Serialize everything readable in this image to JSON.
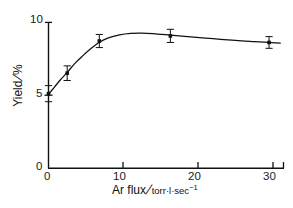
{
  "chart_data": {
    "type": "scatter",
    "title": "",
    "xlabel": "Ar flux / torr·l·sec⁻¹",
    "ylabel": "Yield/%",
    "xlim": [
      0,
      31.5
    ],
    "ylim": [
      0,
      10
    ],
    "xticks": [
      0,
      10,
      20,
      30
    ],
    "yticks": [
      0,
      5,
      10
    ],
    "xtick_labels": [
      "0",
      "10",
      "20",
      "30"
    ],
    "ytick_labels": [
      "0",
      "5",
      "10"
    ],
    "grid": false,
    "legend": null,
    "x": [
      0,
      2.5,
      6.8,
      16.3,
      29.5
    ],
    "values": [
      5.1,
      6.5,
      8.7,
      9.05,
      8.6
    ],
    "yerr": [
      0.55,
      0.5,
      0.45,
      0.45,
      0.4
    ],
    "marker": "square",
    "marker_color": "#111111",
    "line_color": "#111111",
    "fit_curve": [
      [
        0.0,
        5.05
      ],
      [
        0.8,
        5.55
      ],
      [
        1.6,
        6.05
      ],
      [
        2.5,
        6.55
      ],
      [
        3.5,
        7.15
      ],
      [
        4.5,
        7.65
      ],
      [
        5.6,
        8.15
      ],
      [
        6.8,
        8.62
      ],
      [
        8.0,
        8.92
      ],
      [
        9.5,
        9.12
      ],
      [
        11.0,
        9.22
      ],
      [
        12.5,
        9.24
      ],
      [
        14.0,
        9.2
      ],
      [
        16.3,
        9.1
      ],
      [
        19.0,
        8.98
      ],
      [
        22.0,
        8.86
      ],
      [
        25.0,
        8.74
      ],
      [
        27.5,
        8.66
      ],
      [
        29.5,
        8.6
      ],
      [
        31.0,
        8.55
      ]
    ]
  },
  "axis": {
    "y_label_text": "Yield",
    "y_label_unit": "%",
    "x_label_text": "Ar flux",
    "x_label_unit_main": "torr·l·sec",
    "x_label_unit_exp": "−1",
    "slash": "/",
    "y_tick_10": "10",
    "y_tick_5": "5",
    "y_tick_0": "0",
    "x_tick_0": "0",
    "x_tick_10": "10",
    "x_tick_20": "20",
    "x_tick_30": "30"
  },
  "colors": {
    "ink": "#111111",
    "background": "#ffffff"
  }
}
